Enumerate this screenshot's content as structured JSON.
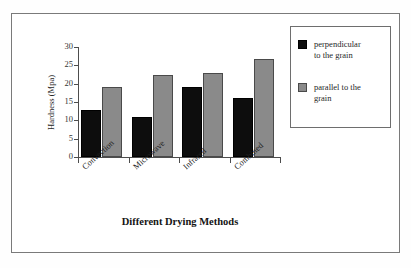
{
  "chart_data": {
    "type": "bar",
    "title": "",
    "xlabel": "Different Drying Methods",
    "ylabel": "Hardness (Mpa)",
    "categories": [
      "Convection",
      "Microwave",
      "Infrared",
      "Combined"
    ],
    "series": [
      {
        "name": "perpendicular to the grain",
        "color": "#0d0d0d",
        "values": [
          12.7,
          11.0,
          19.0,
          16.2
        ]
      },
      {
        "name": "parallel to the grain",
        "color": "#8a8a8a",
        "values": [
          19.0,
          22.3,
          23.0,
          26.7
        ]
      }
    ],
    "ylim": [
      0,
      30
    ],
    "ytick_labels": [
      "30",
      "25",
      "20",
      "15",
      "10",
      "5",
      "0"
    ],
    "ytick_values": [
      30,
      25,
      20,
      15,
      10,
      5,
      0
    ],
    "grid": false,
    "legend_position": "right",
    "legend_entries": [
      {
        "label_line1": "perpendicular",
        "label_line2": "to the grain"
      },
      {
        "label_line1": "parallel to the",
        "label_line2": "grain"
      }
    ]
  }
}
